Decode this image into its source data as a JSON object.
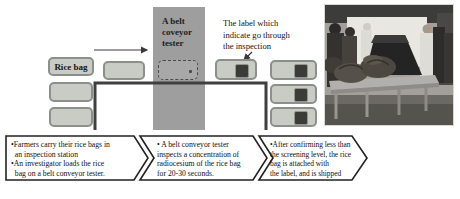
{
  "diagram": {
    "rice_bag_label": "Rice bag",
    "tester_label_lines": [
      "A belt",
      "coveyor",
      "tester"
    ],
    "callout_lines": [
      "The label which",
      "indicate go through",
      "the inspection"
    ],
    "steps": [
      {
        "lines": [
          "•Farmers carry their rice bags in",
          "  an inspection station",
          "•An investigator loads the rice",
          "  bag on a belt conveyor tester."
        ]
      },
      {
        "lines": [
          "• A belt conveyor tester",
          "inspects a concentration of",
          "radiocesium of the rice bag",
          "for 20-30 seconds."
        ]
      },
      {
        "lines": [
          "•After confirming less than",
          "the screening level, the rice",
          "bag is attached with",
          "the label, and is shipped"
        ]
      }
    ],
    "colors": {
      "bag_fill": "#c9ccc4",
      "bag_border": "#8b918a",
      "tester_band": "#9e9e9e",
      "conveyor_line": "#3f3f3f",
      "label_square": "#3b3b37",
      "chevron_border": "#222222",
      "text": "#111111"
    }
  }
}
